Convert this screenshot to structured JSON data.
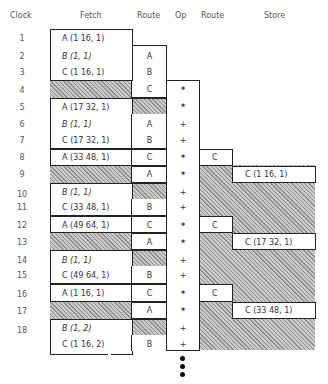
{
  "headers": {
    "clock": "Clock",
    "fetch": "Fetch",
    "route1": "Route",
    "op": "Op",
    "route2": "Route",
    "store": "Store"
  },
  "clocks": [
    "1",
    "2",
    "3",
    "4",
    "5",
    "6",
    "7",
    "8",
    "9",
    "10",
    "11",
    "12",
    "13",
    "14",
    "15",
    "16",
    "17",
    "18"
  ],
  "fetch": {
    "r1": "A (1 16, 1)",
    "r2": "B (1, 1)",
    "r3": "C (1 16, 1)",
    "r5": "A (17 32, 1)",
    "r6": "B (1, 1)",
    "r7": "C (17 32, 1)",
    "r8": "A (33 48, 1)",
    "r10": "B (1, 1)",
    "r11": "C (33 48, 1)",
    "r12": "A (49 64, 1)",
    "r14": "B (1, 1)",
    "r15": "C (49 64, 1)",
    "r16": "A (1 16, 1)",
    "r18": "B (1, 2)",
    "r19": "C (1 16, 2)"
  },
  "route1": {
    "r2": "A",
    "r3": "B",
    "r4": "C",
    "r6": "A",
    "r7": "B",
    "r8": "C",
    "r9": "A",
    "r11": "B",
    "r12": "C",
    "r13": "A",
    "r15": "B",
    "r16": "C",
    "r17": "A",
    "r19": "B"
  },
  "op": {
    "r4": "*",
    "r5": "*",
    "r6": "+",
    "r7": "+",
    "r8": "*",
    "r9": "*",
    "r10": "+",
    "r11": "+",
    "r12": "*",
    "r13": "*",
    "r14": "+",
    "r15": "+",
    "r16": "*",
    "r17": "*",
    "r18": "+",
    "r19": "+"
  },
  "route2": {
    "r8": "C",
    "r12": "C",
    "r16": "C"
  },
  "store": {
    "r9": "C (1 16, 1)",
    "r13": "C (17 32, 1)",
    "r17": "C (33 48, 1)"
  },
  "continuation": "more-cycles-dots"
}
